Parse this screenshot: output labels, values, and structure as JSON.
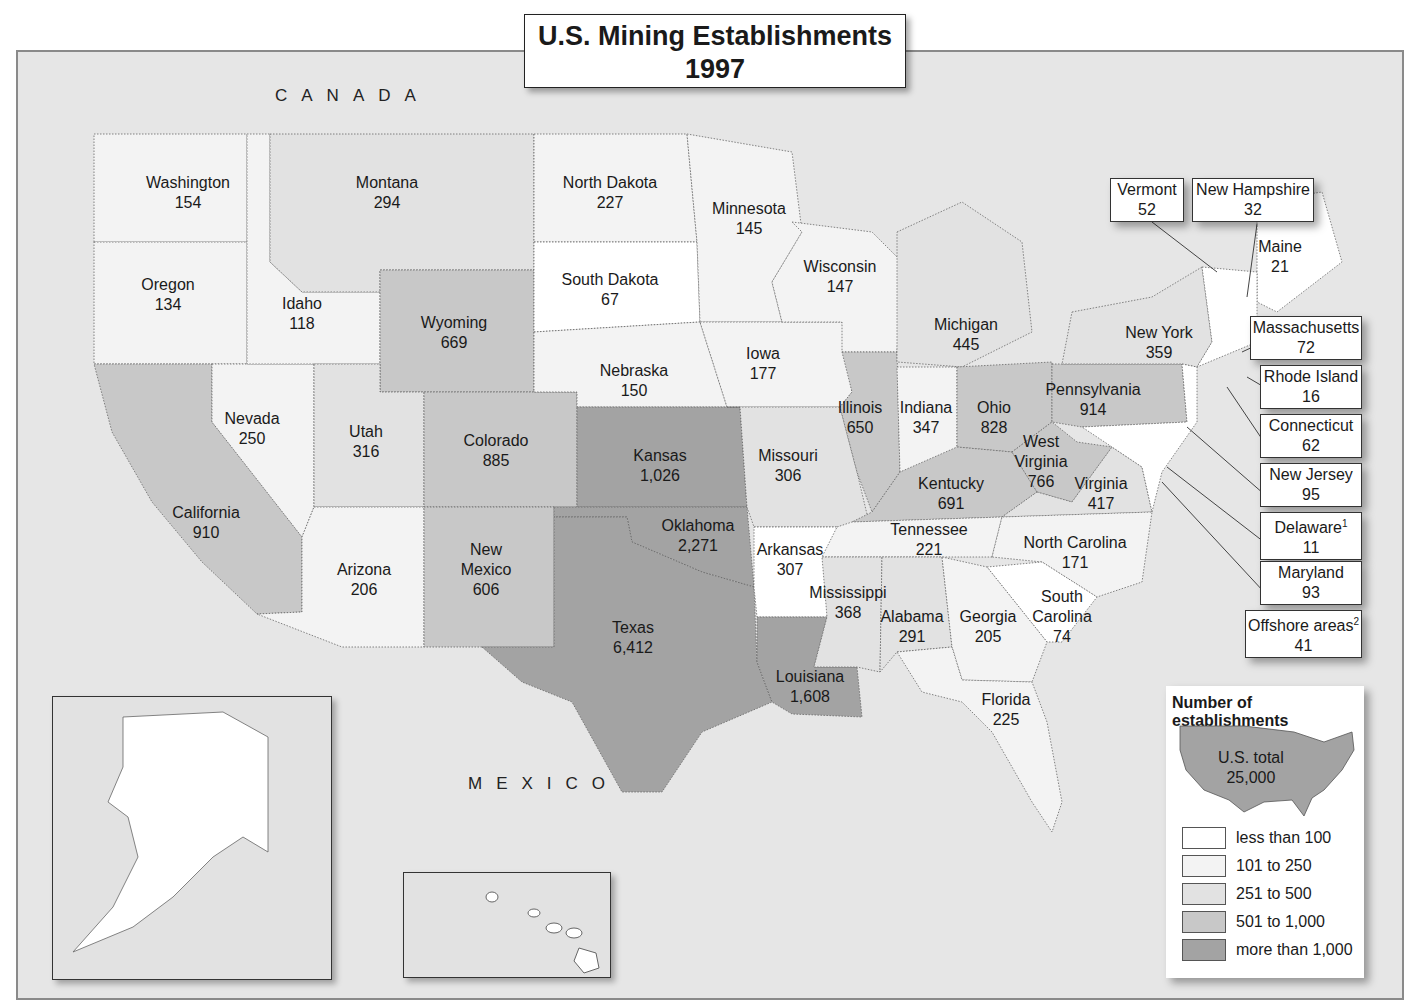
{
  "title": {
    "line1": "U.S. Mining Establishments",
    "line2": "1997"
  },
  "countries": {
    "canada": "CANADA",
    "mexico": "MEXICO"
  },
  "colors": {
    "less_than_100": "#ffffff",
    "101_to_250": "#f3f3f3",
    "251_to_500": "#e2e2e2",
    "501_to_1000": "#c8c8c8",
    "more_than_1000": "#a3a3a3",
    "water": "#e6e6e6"
  },
  "states": {
    "washington": {
      "name": "Washington",
      "value": "154"
    },
    "oregon": {
      "name": "Oregon",
      "value": "134"
    },
    "california": {
      "name": "California",
      "value": "910"
    },
    "idaho": {
      "name": "Idaho",
      "value": "118"
    },
    "nevada": {
      "name": "Nevada",
      "value": "250"
    },
    "montana": {
      "name": "Montana",
      "value": "294"
    },
    "wyoming": {
      "name": "Wyoming",
      "value": "669"
    },
    "utah": {
      "name": "Utah",
      "value": "316"
    },
    "arizona": {
      "name": "Arizona",
      "value": "206"
    },
    "colorado": {
      "name": "Colorado",
      "value": "885"
    },
    "new_mexico": {
      "name1": "New",
      "name2": "Mexico",
      "value": "606"
    },
    "north_dakota": {
      "name": "North Dakota",
      "value": "227"
    },
    "south_dakota": {
      "name": "South Dakota",
      "value": "67"
    },
    "nebraska": {
      "name": "Nebraska",
      "value": "150"
    },
    "kansas": {
      "name": "Kansas",
      "value": "1,026"
    },
    "oklahoma": {
      "name": "Oklahoma",
      "value": "2,271"
    },
    "texas": {
      "name": "Texas",
      "value": "6,412"
    },
    "minnesota": {
      "name": "Minnesota",
      "value": "145"
    },
    "iowa": {
      "name": "Iowa",
      "value": "177"
    },
    "missouri": {
      "name": "Missouri",
      "value": "306"
    },
    "arkansas": {
      "name": "Arkansas",
      "value": "307"
    },
    "louisiana": {
      "name": "Louisiana",
      "value": "1,608"
    },
    "wisconsin": {
      "name": "Wisconsin",
      "value": "147"
    },
    "illinois": {
      "name": "Illinois",
      "value": "650"
    },
    "michigan": {
      "name": "Michigan",
      "value": "445"
    },
    "indiana": {
      "name": "Indiana",
      "value": "347"
    },
    "ohio": {
      "name": "Ohio",
      "value": "828"
    },
    "kentucky": {
      "name": "Kentucky",
      "value": "691"
    },
    "tennessee": {
      "name": "Tennessee",
      "value": "221"
    },
    "mississippi": {
      "name": "Mississippi",
      "value": "368"
    },
    "alabama": {
      "name": "Alabama",
      "value": "291"
    },
    "georgia": {
      "name": "Georgia",
      "value": "205"
    },
    "florida": {
      "name": "Florida",
      "value": "225"
    },
    "south_carolina": {
      "name1": "South",
      "name2": "Carolina",
      "value": "74"
    },
    "north_carolina": {
      "name": "North Carolina",
      "value": "171"
    },
    "virginia": {
      "name": "Virginia",
      "value": "417"
    },
    "west_virginia": {
      "name1": "West",
      "name2": "Virginia",
      "value": "766"
    },
    "pennsylvania": {
      "name": "Pennsylvania",
      "value": "914"
    },
    "new_york": {
      "name": "New York",
      "value": "359"
    },
    "maine": {
      "name": "Maine",
      "value": "21"
    },
    "alaska": {
      "name": "Alaska",
      "value": "141"
    },
    "hawaii": {
      "name": "Hawaii",
      "value": "7"
    }
  },
  "callouts": {
    "vermont": {
      "name": "Vermont",
      "value": "52"
    },
    "new_hampshire": {
      "name": "New Hampshire",
      "value": "32"
    },
    "massachusetts": {
      "name": "Massachusetts",
      "value": "72"
    },
    "rhode_island": {
      "name": "Rhode Island",
      "value": "16"
    },
    "connecticut": {
      "name": "Connecticut",
      "value": "62"
    },
    "new_jersey": {
      "name": "New Jersey",
      "value": "95"
    },
    "delaware": {
      "name": "Delaware",
      "sup": "1",
      "value": "11"
    },
    "maryland": {
      "name": "Maryland",
      "value": "93"
    },
    "offshore": {
      "name": "Offshore areas",
      "sup": "2",
      "value": "41"
    }
  },
  "legend": {
    "title": "Number of establishments",
    "total_label": "U.S. total",
    "total_value": "25,000",
    "items": [
      {
        "label": "less than 100"
      },
      {
        "label": "101 to 250"
      },
      {
        "label": "251 to 500"
      },
      {
        "label": "501 to 1,000"
      },
      {
        "label": "more than 1,000"
      }
    ]
  }
}
